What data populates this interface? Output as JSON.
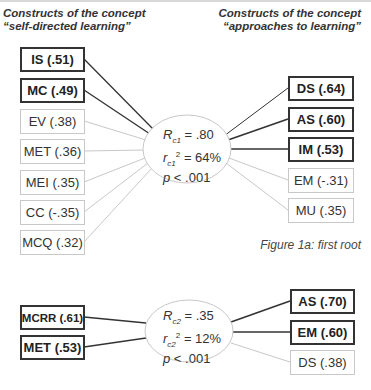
{
  "headers": {
    "left_line1": "Constructs of the concept",
    "left_line2": "“self-directed learning”",
    "right_line1": "Constructs of the concept",
    "right_line2": "“approaches to learning”"
  },
  "root1": {
    "stats": {
      "R_label": "R",
      "R_sub": "c1",
      "R_value": "= .80",
      "r_label": "r",
      "r_sub": "c1",
      "r_sup": "2",
      "r_value": "= 64%",
      "p_label": "p",
      "p_value": "< .001"
    },
    "left_boxes": [
      {
        "label": "IS (.51)",
        "strong": true
      },
      {
        "label": "MC (.49)",
        "strong": true
      },
      {
        "label": "EV (.38)",
        "strong": false
      },
      {
        "label": "MET (.36)",
        "strong": false
      },
      {
        "label": "MEI (.35)",
        "strong": false
      },
      {
        "label": "CC (-.35)",
        "strong": false
      },
      {
        "label": "MCQ (.32)",
        "strong": false
      }
    ],
    "right_boxes": [
      {
        "label": "DS (.64)",
        "strong": true
      },
      {
        "label": "AS (.60)",
        "strong": true
      },
      {
        "label": "IM (.53)",
        "strong": true
      },
      {
        "label": "EM (-.31)",
        "strong": false
      },
      {
        "label": "MU (.35)",
        "strong": false
      }
    ],
    "caption": "Figure 1a: first root"
  },
  "root2": {
    "stats": {
      "R_label": "R",
      "R_sub": "c2",
      "R_value": "= .35",
      "r_label": "r",
      "r_sub": "c2",
      "r_sup": "2",
      "r_value": "= 12%",
      "p_label": "p",
      "p_value": "< .001"
    },
    "left_boxes": [
      {
        "label": "MCRR (.61)",
        "strong": true
      },
      {
        "label": "MET (.53)",
        "strong": true
      }
    ],
    "right_boxes": [
      {
        "label": "AS (.70)",
        "strong": true
      },
      {
        "label": "EM (.60)",
        "strong": true
      },
      {
        "label": "DS (.38)",
        "strong": false
      }
    ]
  },
  "colors": {
    "strong_line": "#333333",
    "weak_line": "#c8c8c8",
    "ellipse_stroke": "#c8c8c8"
  }
}
